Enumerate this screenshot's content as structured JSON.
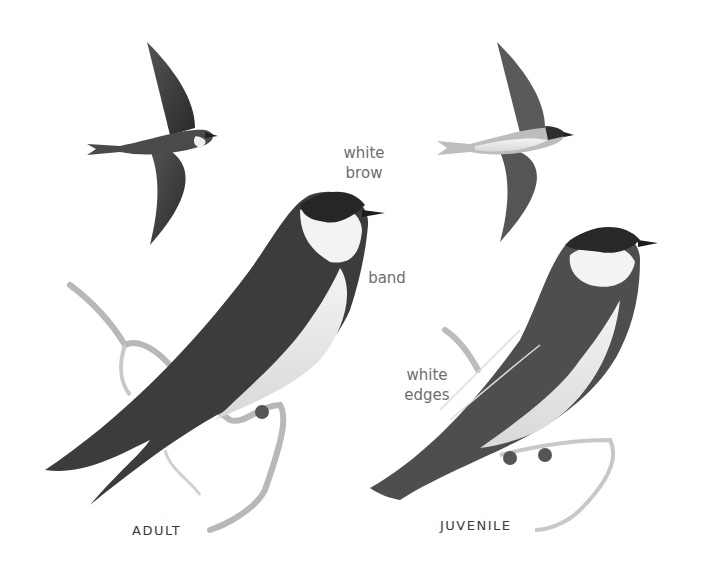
{
  "illustration": {
    "subject": "swallow field-guide plate",
    "palette": {
      "background": "#ffffff",
      "dark": "#2b2b2b",
      "mid": "#6a6a6a",
      "light": "#e6e6e6",
      "label": "#6e6e6e",
      "caption": "#3a3a3a"
    }
  },
  "annotations": {
    "white_brow_line1": "white",
    "white_brow_line2": "brow",
    "band": "band",
    "white_edges_line1": "white",
    "white_edges_line2": "edges"
  },
  "captions": {
    "adult": "ADULT",
    "juvenile": "JUVENILE"
  }
}
